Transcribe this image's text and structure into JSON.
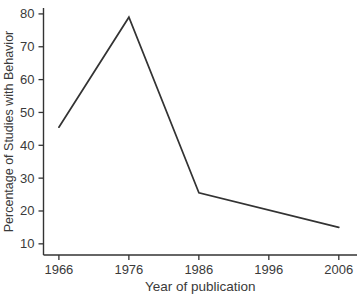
{
  "chart_data": {
    "type": "line",
    "x": [
      1966,
      1976,
      1986,
      2006
    ],
    "y": [
      45.5,
      79,
      25.5,
      15
    ],
    "x_ticks": [
      "1966",
      "1976",
      "1986",
      "1996",
      "2006"
    ],
    "x_tick_values": [
      1966,
      1976,
      1986,
      1996,
      2006
    ],
    "y_ticks": [
      "10",
      "20",
      "30",
      "40",
      "50",
      "60",
      "70",
      "80"
    ],
    "y_tick_values": [
      10,
      20,
      30,
      40,
      50,
      60,
      70,
      80
    ],
    "xlabel": "Year of publication",
    "ylabel": "Percentage of Studies with Behavior",
    "title": "",
    "xlim": [
      1963.8,
      2008.6
    ],
    "ylim": [
      6.6,
      81.8
    ],
    "grid": false,
    "legend_position": "none",
    "line_color": "#333333",
    "axis_color": "#333333",
    "text_color": "#3a3a3a",
    "background_color": "#ffffff"
  }
}
